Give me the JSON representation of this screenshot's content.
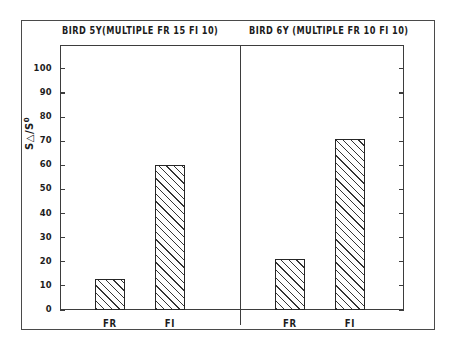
{
  "figure": {
    "y_axis_title_main": "S",
    "y_axis_title_delta": "△",
    "y_axis_title_sep": "/S",
    "y_axis_title_zero": "0",
    "y_axis_title_plain": "S△/S0"
  },
  "panels": [
    {
      "id": "left",
      "title": "BIRD 5Y(MULTIPLE FR 15  FI 10)",
      "subject": "BIRD 5Y",
      "schedule": "MULTIPLE FR 15 FI 10",
      "bars": [
        {
          "label": "FR",
          "value": 13
        },
        {
          "label": "FI",
          "value": 60
        }
      ]
    },
    {
      "id": "right",
      "title": "BIRD 6Y (MULTIPLE FR 10   FI 10)",
      "subject": "BIRD 6Y",
      "schedule": "MULTIPLE FR 10 FI 10",
      "bars": [
        {
          "label": "FR",
          "value": 21
        },
        {
          "label": "FI",
          "value": 71
        }
      ]
    }
  ],
  "y_ticks": [
    {
      "label": "100",
      "value": 100
    },
    {
      "label": "90",
      "value": 90
    },
    {
      "label": "80",
      "value": 80
    },
    {
      "label": "70",
      "value": 70
    },
    {
      "label": "60",
      "value": 60
    },
    {
      "label": "50",
      "value": 50
    },
    {
      "label": "40",
      "value": 40
    },
    {
      "label": "30",
      "value": 30
    },
    {
      "label": "20",
      "value": 20
    },
    {
      "label": "10",
      "value": 10
    },
    {
      "label": "0",
      "value": 0
    }
  ],
  "colors": {
    "ink": "#1c1c1c",
    "frame": "#3d3d3d",
    "bar_edge": "#262626",
    "bar_hatch": "#333333",
    "background": "#ffffff"
  },
  "chart_data": {
    "type": "bar",
    "title": "",
    "xlabel": "",
    "ylabel": "S△/S0",
    "ylim": [
      0,
      107
    ],
    "y_ticks": [
      0,
      10,
      20,
      30,
      40,
      50,
      60,
      70,
      80,
      90,
      100
    ],
    "grid": false,
    "legend": "none",
    "panels": [
      {
        "panel_title": "BIRD 5Y(MULTIPLE FR 15  FI 10)",
        "categories": [
          "FR",
          "FI"
        ],
        "values": [
          13,
          60
        ]
      },
      {
        "panel_title": "BIRD 6Y (MULTIPLE FR 10   FI 10)",
        "categories": [
          "FR",
          "FI"
        ],
        "values": [
          21,
          71
        ]
      }
    ]
  }
}
